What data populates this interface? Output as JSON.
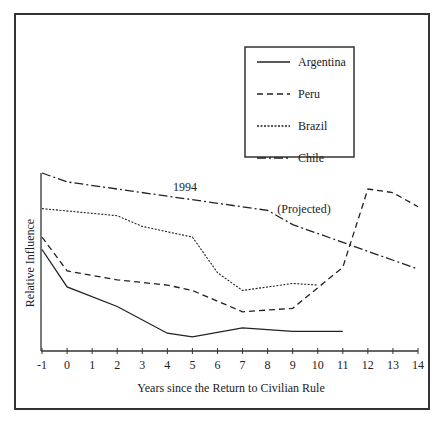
{
  "chart_data": {
    "type": "line",
    "title": "",
    "xlabel": "Years since the Return to Civilian Rule",
    "ylabel": "Relative Influence",
    "x_ticks": [
      -1,
      0,
      1,
      2,
      3,
      4,
      5,
      6,
      7,
      8,
      9,
      10,
      11,
      12,
      13,
      14
    ],
    "xlim": [
      -1,
      14
    ],
    "ylim": [
      0,
      100
    ],
    "y_ticks_labeled": false,
    "grid": false,
    "legend_position": "upper right (inset box)",
    "series": [
      {
        "name": "Argentina",
        "style": "solid",
        "points": [
          [
            -1,
            57
          ],
          [
            0,
            36
          ],
          [
            2,
            25
          ],
          [
            4,
            10
          ],
          [
            5,
            8
          ],
          [
            7,
            13
          ],
          [
            9,
            11
          ],
          [
            11,
            11
          ]
        ]
      },
      {
        "name": "Peru",
        "style": "dashed",
        "points": [
          [
            -1,
            64
          ],
          [
            0,
            45
          ],
          [
            2,
            40
          ],
          [
            4,
            37
          ],
          [
            5,
            34
          ],
          [
            7,
            22
          ],
          [
            9,
            24
          ],
          [
            11,
            47
          ],
          [
            12,
            91
          ],
          [
            13,
            89
          ],
          [
            14,
            81
          ]
        ]
      },
      {
        "name": "Brazil",
        "style": "dotted",
        "points": [
          [
            -1,
            80
          ],
          [
            2,
            76
          ],
          [
            3,
            70
          ],
          [
            5,
            64
          ],
          [
            6,
            44
          ],
          [
            7,
            34
          ],
          [
            9,
            38
          ],
          [
            10,
            37
          ]
        ]
      },
      {
        "name": "Chile",
        "style": "dash-dot",
        "points": [
          [
            -1,
            100
          ],
          [
            0,
            95
          ],
          [
            8,
            79
          ],
          [
            9,
            71
          ],
          [
            14,
            46
          ]
        ]
      }
    ],
    "annotations": [
      {
        "text": "1994",
        "x": 4.3,
        "y": 92
      },
      {
        "text": "(Projected)",
        "x": 9.4,
        "y": 80
      }
    ]
  },
  "legend": {
    "items": [
      {
        "label": "Argentina",
        "style": "solid"
      },
      {
        "label": "Peru",
        "style": "dashed"
      },
      {
        "label": "Brazil",
        "style": "dotted"
      },
      {
        "label": "Chile",
        "style": "dash-dot"
      }
    ]
  },
  "axes": {
    "xlabel": "Years since the Return to Civilian Rule",
    "ylabel": "Relative Influence",
    "x_tick_labels": [
      "-1",
      "0",
      "1",
      "2",
      "3",
      "4",
      "5",
      "6",
      "7",
      "8",
      "9",
      "10",
      "11",
      "12",
      "13",
      "14"
    ]
  },
  "annotations": {
    "year_label": "1994",
    "projected_label": "(Projected)"
  }
}
